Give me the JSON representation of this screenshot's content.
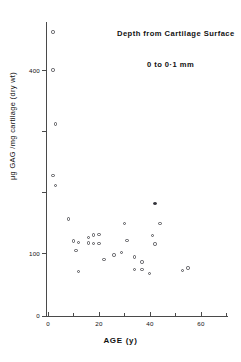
{
  "chart_data": {
    "type": "scatter",
    "title": "",
    "annotations": [
      "Depth from Cartilage Surface",
      "0 to 0·1 mm"
    ],
    "xlabel": "AGE (y)",
    "ylabel": "μg GAG /mg cartilage (dry wt)",
    "xlim": [
      0,
      72
    ],
    "ylim": [
      0,
      480
    ],
    "xticks": [
      0,
      10,
      20,
      30,
      40,
      50,
      60,
      70
    ],
    "xticklabels": [
      "0",
      "",
      "20",
      "",
      "40",
      "",
      "60",
      ""
    ],
    "yticks": [
      0,
      100,
      200,
      300,
      400
    ],
    "yticklabels": [
      "0",
      "100",
      "",
      "",
      "400"
    ],
    "grid": false,
    "legend": false,
    "marker": "open-circle",
    "marker_color": "#55555a",
    "points": [
      {
        "x": 2,
        "y": 462,
        "filled": false
      },
      {
        "x": 2,
        "y": 400,
        "filled": false
      },
      {
        "x": 3,
        "y": 312,
        "filled": false
      },
      {
        "x": 2,
        "y": 228,
        "filled": false
      },
      {
        "x": 3,
        "y": 212,
        "filled": false
      },
      {
        "x": 8,
        "y": 158,
        "filled": false
      },
      {
        "x": 10,
        "y": 122,
        "filled": false
      },
      {
        "x": 12,
        "y": 120,
        "filled": false
      },
      {
        "x": 11,
        "y": 107,
        "filled": false
      },
      {
        "x": 16,
        "y": 128,
        "filled": false
      },
      {
        "x": 18,
        "y": 132,
        "filled": false
      },
      {
        "x": 20,
        "y": 133,
        "filled": false
      },
      {
        "x": 16,
        "y": 119,
        "filled": false
      },
      {
        "x": 18,
        "y": 118,
        "filled": false
      },
      {
        "x": 20,
        "y": 118,
        "filled": false
      },
      {
        "x": 12,
        "y": 72,
        "filled": false
      },
      {
        "x": 22,
        "y": 92,
        "filled": false
      },
      {
        "x": 26,
        "y": 99,
        "filled": false
      },
      {
        "x": 29,
        "y": 103,
        "filled": false
      },
      {
        "x": 31,
        "y": 123,
        "filled": false
      },
      {
        "x": 30,
        "y": 150,
        "filled": false
      },
      {
        "x": 34,
        "y": 96,
        "filled": false
      },
      {
        "x": 34,
        "y": 76,
        "filled": false
      },
      {
        "x": 37,
        "y": 76,
        "filled": false
      },
      {
        "x": 37,
        "y": 88,
        "filled": false
      },
      {
        "x": 40,
        "y": 69,
        "filled": false
      },
      {
        "x": 41,
        "y": 131,
        "filled": false
      },
      {
        "x": 42,
        "y": 117,
        "filled": false
      },
      {
        "x": 42,
        "y": 183,
        "filled": true
      },
      {
        "x": 44,
        "y": 150,
        "filled": false
      },
      {
        "x": 53,
        "y": 74,
        "filled": false
      },
      {
        "x": 55,
        "y": 78,
        "filled": false
      }
    ]
  }
}
